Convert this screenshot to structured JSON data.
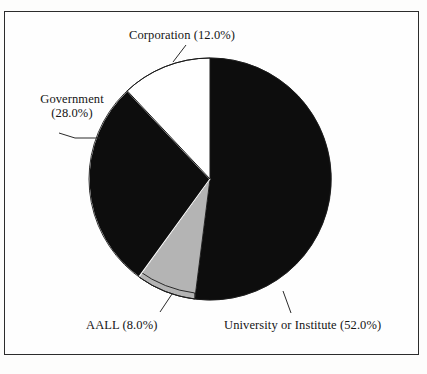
{
  "figure": {
    "background_color": "#fdfdfc",
    "frame_color": "#2c2c2c",
    "text_color": "#151515"
  },
  "labels": {
    "corporation": "Corporation (12.0%)",
    "government_name": "Government",
    "government_value": "(28.0%)",
    "aall": "AALL (8.0%)",
    "university": "University or Institute (52.0%)"
  },
  "chart_data": {
    "type": "pie",
    "title": "",
    "subtitle": "",
    "xlabel": "",
    "ylabel": "",
    "legend_position": "none",
    "labels_position": "outside-with-leader-lines",
    "start_angle_deg": 0,
    "direction": "clockwise",
    "categories": [
      "University or Institute",
      "AALL",
      "Government",
      "Corporation"
    ],
    "values": [
      52.0,
      8.0,
      28.0,
      12.0
    ],
    "units": "percent",
    "total": 100.0,
    "slices": [
      {
        "name": "University or Institute",
        "value": 52.0,
        "display": "University or Institute (52.0%)",
        "color": "#0d0d0d",
        "start_deg": 0.0,
        "end_deg": 187.2
      },
      {
        "name": "AALL",
        "value": 8.0,
        "display": "AALL (8.0%)",
        "color": "#b4b4b4",
        "start_deg": 187.2,
        "end_deg": 216.0
      },
      {
        "name": "Government",
        "value": 28.0,
        "display": "Government (28.0%)",
        "color": "#0d0d0d",
        "start_deg": 216.0,
        "end_deg": 316.8
      },
      {
        "name": "Corporation",
        "value": 12.0,
        "display": "Corporation (12.0%)",
        "color": "#ffffff",
        "start_deg": 316.8,
        "end_deg": 360.0
      }
    ]
  }
}
